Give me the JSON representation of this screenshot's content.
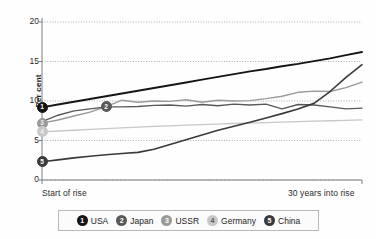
{
  "chart_data": {
    "type": "line",
    "title": "",
    "subtitle": "",
    "xlabel": "",
    "ylabel": "Per cent",
    "ylim": [
      0,
      20
    ],
    "xlim": [
      0,
      30
    ],
    "yticks": [
      "0",
      "5",
      "10",
      "15",
      "20"
    ],
    "ytick_values": [
      0,
      5,
      10,
      15,
      20
    ],
    "x_axis_start_label": "Start of rise",
    "x_axis_end_label": "30 years into rise",
    "grid": "horizontal-dotted",
    "legend_position": "bottom",
    "x": [
      0,
      1.5,
      3,
      4.5,
      6,
      7.5,
      9,
      10.5,
      12,
      13.5,
      15,
      16.5,
      18,
      19.5,
      21,
      22.5,
      24,
      25.5,
      27,
      28.5,
      30
    ],
    "series": [
      {
        "name": "USA",
        "number": "1",
        "color": "#151515",
        "width": 1.9,
        "marker_x": 0,
        "marker_y": 9.2,
        "values": [
          9.2,
          9.55,
          9.9,
          10.25,
          10.6,
          10.95,
          11.3,
          11.65,
          12.0,
          12.35,
          12.7,
          13.05,
          13.4,
          13.75,
          14.05,
          14.4,
          14.7,
          15.05,
          15.4,
          15.8,
          16.2
        ]
      },
      {
        "name": "Japan",
        "number": "2",
        "color": "#595959",
        "width": 1.4,
        "marker_x": 6,
        "marker_y": 9.25,
        "values": [
          7.4,
          8.2,
          8.75,
          9.0,
          9.25,
          9.25,
          9.3,
          9.45,
          9.5,
          9.35,
          9.55,
          9.4,
          9.6,
          9.5,
          9.6,
          9.0,
          9.55,
          9.5,
          9.25,
          9.0,
          9.1
        ]
      },
      {
        "name": "USSR",
        "number": "3",
        "color": "#9a9a9a",
        "width": 1.4,
        "marker_x": 0,
        "marker_y": 7.2,
        "values": [
          7.2,
          7.6,
          8.1,
          8.6,
          9.3,
          10.1,
          9.85,
          10.0,
          9.95,
          10.15,
          9.85,
          10.1,
          10.0,
          10.05,
          10.3,
          10.6,
          11.1,
          11.25,
          11.2,
          11.7,
          12.4
        ]
      },
      {
        "name": "Germany",
        "number": "4",
        "color": "#c8c8c8",
        "width": 1.3,
        "marker_x": 0,
        "marker_y": 6.1,
        "values": [
          6.1,
          6.2,
          6.3,
          6.4,
          6.5,
          6.6,
          6.7,
          6.78,
          6.86,
          6.94,
          7.0,
          7.08,
          7.15,
          7.2,
          7.26,
          7.32,
          7.38,
          7.45,
          7.5,
          7.55,
          7.6
        ]
      },
      {
        "name": "China",
        "number": "5",
        "color": "#3a3a3a",
        "width": 1.6,
        "marker_x": 0,
        "marker_y": 2.3,
        "values": [
          2.3,
          2.55,
          2.8,
          3.0,
          3.2,
          3.35,
          3.5,
          3.9,
          4.5,
          5.1,
          5.7,
          6.3,
          6.8,
          7.3,
          7.85,
          8.4,
          9.0,
          9.7,
          11.2,
          13.0,
          14.6
        ]
      }
    ]
  },
  "legend": {
    "items": [
      {
        "number": "1",
        "label": "USA",
        "color": "#151515",
        "text_color": "#ffffff"
      },
      {
        "number": "2",
        "label": "Japan",
        "color": "#595959",
        "text_color": "#ffffff"
      },
      {
        "number": "3",
        "label": "USSR",
        "color": "#9a9a9a",
        "text_color": "#ffffff"
      },
      {
        "number": "4",
        "label": "Germany",
        "color": "#c8c8c8",
        "text_color": "#5a5a5a"
      },
      {
        "number": "5",
        "label": "China",
        "color": "#3a3a3a",
        "text_color": "#ffffff"
      }
    ]
  },
  "colors": {
    "background": "#fefefe",
    "axis": "#8f8f8f",
    "grid": "#888888",
    "text": "#1e1e1e"
  }
}
